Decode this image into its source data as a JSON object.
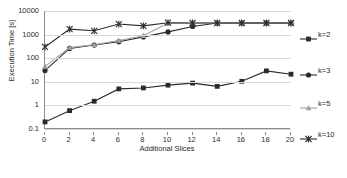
{
  "chart_data": {
    "type": "line",
    "title": "",
    "xlabel": "Additional Slices",
    "ylabel": "Execution Time [s]",
    "yscale": "log",
    "ylim": [
      0.1,
      10000
    ],
    "xlim": [
      0,
      20
    ],
    "grid": true,
    "legend_position": "right",
    "x": [
      0,
      2,
      4,
      6,
      8,
      10,
      12,
      14,
      16,
      18,
      20
    ],
    "xticks": [
      "0",
      "2",
      "4",
      "6",
      "8",
      "10",
      "12",
      "14",
      "16",
      "18",
      "20"
    ],
    "yticks": [
      "0.1",
      "1",
      "10",
      "100",
      "1000",
      "10000"
    ],
    "series": [
      {
        "name": "k=2",
        "marker": "square",
        "color": "#2b2b2b",
        "values": [
          0.2,
          0.6,
          1.5,
          5.0,
          5.5,
          7.2,
          8.8,
          6.4,
          10.5,
          29,
          21
        ]
      },
      {
        "name": "k=3",
        "marker": "circle",
        "color": "#2b2b2b",
        "values": [
          30,
          260,
          360,
          500,
          800,
          1300,
          2200,
          3100,
          3100,
          3100,
          3100
        ]
      },
      {
        "name": "k=5",
        "marker": "triangle",
        "color": "#a0a0a0",
        "values": [
          45,
          280,
          370,
          560,
          900,
          3100,
          3100,
          3100,
          3100,
          3100,
          3100
        ]
      },
      {
        "name": "k=10",
        "marker": "asterisk",
        "color": "#2b2b2b",
        "values": [
          300,
          1700,
          1450,
          2800,
          2350,
          3200,
          3100,
          3100,
          3100,
          3100,
          3100
        ]
      }
    ]
  },
  "legend": {
    "entries": [
      {
        "label": "k=2"
      },
      {
        "label": "k=3"
      },
      {
        "label": "k=5"
      },
      {
        "label": "k=10"
      }
    ]
  },
  "axes": {
    "x_title": "Additional Slices",
    "y_title": "Execution Time [s]"
  }
}
